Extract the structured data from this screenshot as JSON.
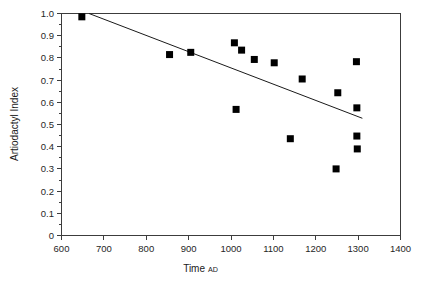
{
  "chart_data": {
    "type": "scatter",
    "title": "",
    "xlabel": "Time",
    "xlabel_suffix": "AD",
    "ylabel": "Artiodactyl Index",
    "xlim": [
      600,
      1400
    ],
    "ylim": [
      0,
      1.0
    ],
    "grid": false,
    "legend": null,
    "xticks": [
      600,
      700,
      800,
      900,
      1000,
      1100,
      1200,
      1300,
      1400
    ],
    "xtick_labels": [
      "600",
      "700",
      "800",
      "900",
      "1000",
      "1100",
      "1200",
      "1300",
      "1400"
    ],
    "yticks": [
      0,
      0.1,
      0.2,
      0.3,
      0.4,
      0.5,
      0.6,
      0.7,
      0.8,
      0.9,
      1.0
    ],
    "ytick_labels": [
      "0",
      "0.1",
      "0.2",
      "0.3",
      "0.4",
      "0.5",
      "0.6",
      "0.7",
      "0.8",
      "0.9",
      "1.0"
    ],
    "minor_yticks": [
      0.05,
      0.15,
      0.25,
      0.35,
      0.45,
      0.55,
      0.65,
      0.75,
      0.85,
      0.95
    ],
    "marker": "filled-square",
    "marker_color": "#000000",
    "points": [
      {
        "x": 648,
        "y": 0.985
      },
      {
        "x": 855,
        "y": 0.815
      },
      {
        "x": 905,
        "y": 0.825
      },
      {
        "x": 1008,
        "y": 0.868
      },
      {
        "x": 1012,
        "y": 0.568
      },
      {
        "x": 1025,
        "y": 0.835
      },
      {
        "x": 1055,
        "y": 0.793
      },
      {
        "x": 1102,
        "y": 0.778
      },
      {
        "x": 1140,
        "y": 0.436
      },
      {
        "x": 1168,
        "y": 0.705
      },
      {
        "x": 1248,
        "y": 0.3
      },
      {
        "x": 1252,
        "y": 0.643
      },
      {
        "x": 1296,
        "y": 0.783
      },
      {
        "x": 1297,
        "y": 0.575
      },
      {
        "x": 1297,
        "y": 0.448
      },
      {
        "x": 1298,
        "y": 0.39
      }
    ],
    "trend_line": {
      "x_start": 665,
      "y_start": 1.0,
      "x_end": 1310,
      "y_end": 0.528,
      "color": "#1a1a1a"
    }
  }
}
